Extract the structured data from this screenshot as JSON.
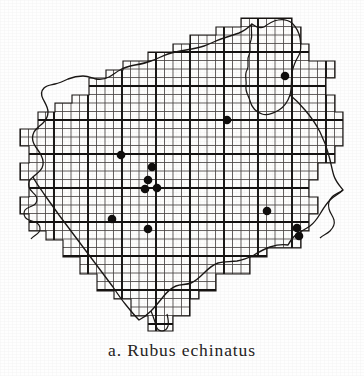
{
  "figure": {
    "label": "a.",
    "caption": "a. Rubus echinatus",
    "taxon_name": "Rubus echinatus",
    "type": "distribution-dot-map"
  },
  "map": {
    "title": "Rubus echinatus distribution map",
    "grid": {
      "visible": true,
      "minor_cell_px": 8.5,
      "major_every_cells": 4,
      "minor_color": "#4a4644",
      "major_color": "#141211"
    },
    "outline": {
      "style": "irregular wavy coastline and river boundary",
      "color": "#1a1715",
      "stroke_px": 1.4
    },
    "dot_symbol": {
      "shape": "filled-circle",
      "color": "#100e0d",
      "radius_px": 4.2,
      "meaning": "recorded occurrence"
    },
    "record_count": 12,
    "records": [
      {
        "id": 1,
        "x": 285,
        "y": 76
      },
      {
        "id": 2,
        "x": 227,
        "y": 120
      },
      {
        "id": 3,
        "x": 121,
        "y": 155
      },
      {
        "id": 4,
        "x": 152,
        "y": 167
      },
      {
        "id": 5,
        "x": 148,
        "y": 180
      },
      {
        "id": 6,
        "x": 145,
        "y": 189
      },
      {
        "id": 7,
        "x": 157,
        "y": 188
      },
      {
        "id": 8,
        "x": 112,
        "y": 219
      },
      {
        "id": 9,
        "x": 267,
        "y": 211
      },
      {
        "id": 10,
        "x": 148,
        "y": 229
      },
      {
        "id": 11,
        "x": 297,
        "y": 228
      },
      {
        "id": 12,
        "x": 299,
        "y": 236
      }
    ]
  },
  "colors": {
    "paper": "#fefefe",
    "ink": "#1a1715",
    "grid_minor": "#4a4644",
    "grid_major": "#141211",
    "dot": "#100e0d",
    "caption_text": "#262322"
  }
}
